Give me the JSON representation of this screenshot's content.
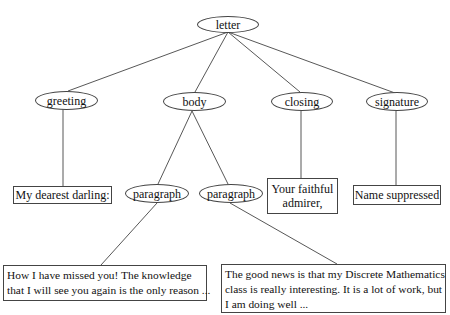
{
  "diagram": {
    "type": "tree",
    "root": {
      "label": "letter"
    },
    "nodes": {
      "letter": {
        "label": "letter",
        "shape": "ellipse"
      },
      "greeting": {
        "label": "greeting",
        "shape": "ellipse"
      },
      "body": {
        "label": "body",
        "shape": "ellipse"
      },
      "closing": {
        "label": "closing",
        "shape": "ellipse"
      },
      "signature": {
        "label": "signature",
        "shape": "ellipse"
      },
      "paragraph1": {
        "label": "paragraph",
        "shape": "ellipse"
      },
      "paragraph2": {
        "label": "paragraph",
        "shape": "ellipse"
      },
      "greeting_text": {
        "label": "My dearest darling:",
        "shape": "box"
      },
      "closing_text": {
        "lines": [
          "Your faithful",
          "admirer,"
        ],
        "shape": "box"
      },
      "signature_text": {
        "label": "Name suppressed",
        "shape": "box"
      },
      "paragraph1_text": {
        "lines": [
          "How I have missed you! The knowledge",
          "that I will see you again is the only reason ..."
        ],
        "shape": "box"
      },
      "paragraph2_text": {
        "lines": [
          "The good news is that my Discrete Mathematics",
          "class is really interesting. It is a lot of work, but",
          "I am doing well ..."
        ],
        "shape": "box"
      }
    },
    "edges": [
      [
        "letter",
        "greeting"
      ],
      [
        "letter",
        "body"
      ],
      [
        "letter",
        "closing"
      ],
      [
        "letter",
        "signature"
      ],
      [
        "greeting",
        "greeting_text"
      ],
      [
        "body",
        "paragraph1"
      ],
      [
        "body",
        "paragraph2"
      ],
      [
        "closing",
        "closing_text"
      ],
      [
        "signature",
        "signature_text"
      ],
      [
        "paragraph1",
        "paragraph1_text"
      ],
      [
        "paragraph2",
        "paragraph2_text"
      ]
    ],
    "colors": {
      "stroke": "#444444",
      "text": "#111111",
      "background": "#ffffff"
    }
  }
}
